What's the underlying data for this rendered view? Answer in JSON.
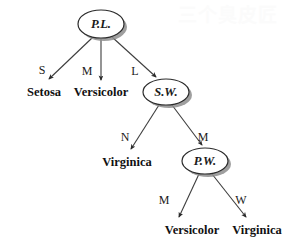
{
  "figure": {
    "background_color": "#ffffff",
    "line_color": "#3d3d3d",
    "node_fill": "#ffffff",
    "node_stroke": "#2b2b2b",
    "shadow_color": "#8e8e8e",
    "text_color": "#111111"
  },
  "watermark": {
    "text": "三个臭皮匠",
    "color": "#fbfbfb"
  },
  "nodes": {
    "root": {
      "label": "P.L.",
      "cx": 101,
      "cy": 24,
      "rx": 23,
      "ry": 14
    },
    "sw": {
      "label": "S.W.",
      "cx": 166,
      "cy": 92,
      "rx": 23,
      "ry": 13
    },
    "pw": {
      "label": "P.W.",
      "cx": 205,
      "cy": 161,
      "rx": 23,
      "ry": 13
    }
  },
  "leaves": [
    {
      "name": "leaf-setosa",
      "label": "Setosa",
      "x": 44,
      "y": 93
    },
    {
      "name": "leaf-versicolor-top",
      "label": "Versicolor",
      "x": 101,
      "y": 93
    },
    {
      "name": "leaf-virginica-mid",
      "label": "Virginica",
      "x": 127,
      "y": 163
    },
    {
      "name": "leaf-versicolor-bottom",
      "label": "Versicolor",
      "x": 192,
      "y": 231
    },
    {
      "name": "leaf-virginica-bottom",
      "label": "Virginica",
      "x": 257,
      "y": 231
    }
  ],
  "edges": [
    {
      "name": "edge-root-setosa",
      "label": "S",
      "from": "P.L.",
      "to": "Setosa",
      "x1": 92,
      "y1": 38,
      "x2": 47,
      "y2": 81,
      "lx": 42,
      "ly": 71
    },
    {
      "name": "edge-root-versicolor",
      "label": "M",
      "from": "P.L.",
      "to": "Versicolor",
      "x1": 101,
      "y1": 39,
      "x2": 101,
      "y2": 82,
      "lx": 87,
      "ly": 72
    },
    {
      "name": "edge-root-sw",
      "label": "L",
      "from": "P.L.",
      "to": "S.W.",
      "x1": 112,
      "y1": 38,
      "x2": 157,
      "y2": 79,
      "lx": 135,
      "ly": 72
    },
    {
      "name": "edge-sw-virginica",
      "label": "N",
      "from": "S.W.",
      "to": "Virginica",
      "x1": 159,
      "y1": 106,
      "x2": 129,
      "y2": 151,
      "lx": 125,
      "ly": 138
    },
    {
      "name": "edge-sw-pw",
      "label": "M",
      "from": "S.W.",
      "to": "P.W.",
      "x1": 172,
      "y1": 106,
      "x2": 203,
      "y2": 147,
      "lx": 203,
      "ly": 138
    },
    {
      "name": "edge-pw-versicolor",
      "label": "M",
      "from": "P.W.",
      "to": "Versicolor",
      "x1": 199,
      "y1": 175,
      "x2": 177,
      "y2": 219,
      "lx": 164,
      "ly": 201
    },
    {
      "name": "edge-pw-virginica",
      "label": "W",
      "from": "P.W.",
      "to": "Virginica",
      "x1": 212,
      "y1": 175,
      "x2": 248,
      "y2": 219,
      "lx": 241,
      "ly": 201
    }
  ],
  "tree_structure": {
    "split_attribute": "P.L.",
    "branches": [
      {
        "value": "S",
        "result": "Setosa",
        "type": "leaf"
      },
      {
        "value": "M",
        "result": "Versicolor",
        "type": "leaf"
      },
      {
        "value": "L",
        "result": "S.W.",
        "type": "node",
        "branches": [
          {
            "value": "N",
            "result": "Virginica",
            "type": "leaf"
          },
          {
            "value": "M",
            "result": "P.W.",
            "type": "node",
            "branches": [
              {
                "value": "M",
                "result": "Versicolor",
                "type": "leaf"
              },
              {
                "value": "W",
                "result": "Virginica",
                "type": "leaf"
              }
            ]
          }
        ]
      }
    ]
  }
}
